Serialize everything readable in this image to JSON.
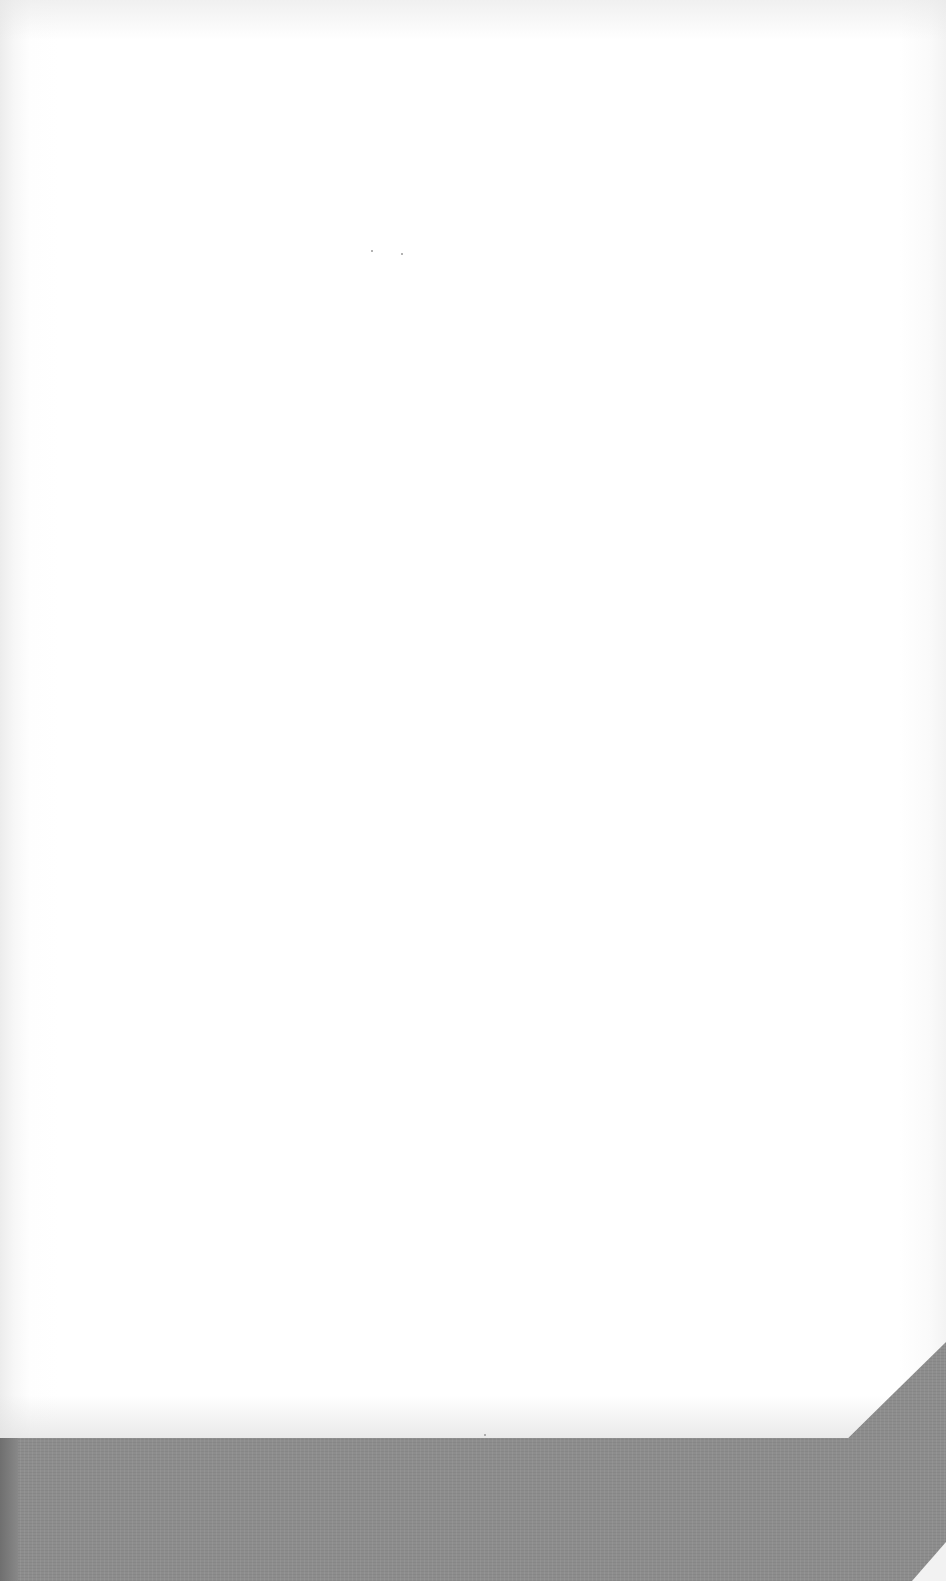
{
  "document": {
    "type": "scanned-page",
    "content": "",
    "state": "blank"
  },
  "colors": {
    "page": "#ffffff",
    "backing_surface": "#8d8d8d"
  }
}
